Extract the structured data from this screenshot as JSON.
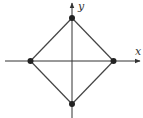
{
  "diagram": {
    "type": "square rotated 45 degrees (diamond) centered at origin",
    "axes": {
      "x_label": "x",
      "y_label": "y"
    },
    "vertices": [
      {
        "name": "top",
        "x": 0,
        "y": 1
      },
      {
        "name": "right",
        "x": 1,
        "y": 0
      },
      {
        "name": "bottom",
        "x": 0,
        "y": -1
      },
      {
        "name": "left",
        "x": -1,
        "y": 0
      }
    ],
    "colors": {
      "line": "#444444",
      "vertex": "#222222",
      "axis": "#333333"
    }
  }
}
